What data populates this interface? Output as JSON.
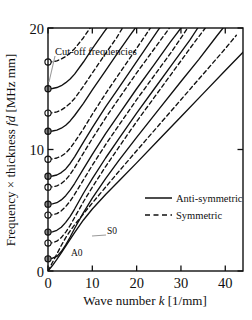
{
  "figure": {
    "kind": "lamb-wave-dispersion-plot",
    "background_color": "#ffffff",
    "line_color": "#101010",
    "frame_color": "#101010",
    "marker_open_fill": "#ffffff",
    "marker_filled_fill": "#8c8c8c",
    "leader_color": "#9a9a9a"
  },
  "chart_data": {
    "type": "line",
    "title": "",
    "xlabel_parts": {
      "pre": "Wave number ",
      "italic": "k",
      "post": " [1/mm]"
    },
    "ylabel_parts": {
      "pre": "Frequency × thickness ",
      "italic": "fd",
      "post": " [MHz mm]"
    },
    "xlabel": "Wave number k [1/mm]",
    "ylabel": "Frequency × thickness fd [MHz mm]",
    "xlim": [
      0,
      44
    ],
    "ylim": [
      0,
      20
    ],
    "xticks": [
      0,
      10,
      20,
      30,
      40
    ],
    "xtick_labels": [
      "0",
      "10",
      "20",
      "30",
      "40"
    ],
    "yticks": [
      0,
      10,
      20
    ],
    "ytick_labels": [
      "0",
      "10",
      "20"
    ],
    "grid": false,
    "legend_position": "center-right",
    "legend": [
      {
        "label": "Anti-symmetric",
        "style": "solid"
      },
      {
        "label": "Symmetric",
        "style": "dashed"
      }
    ],
    "annotations": [
      {
        "text": "Cut-off frequencies",
        "x_px": 55,
        "y_px": 52,
        "leader_to_x_px": 49,
        "leader_to_y_px": 82
      },
      {
        "text": "S0",
        "x_px": 106,
        "y_px": 231,
        "leader_to_x_px": 92,
        "leader_to_y_px": 236
      },
      {
        "text": "A0",
        "x_px": 71,
        "y_px": 253
      }
    ],
    "cutoff_frequencies": [
      {
        "fd": 1.0,
        "marker": "filled",
        "mode": "A1"
      },
      {
        "fd": 2.3,
        "marker": "open",
        "mode": "S1"
      },
      {
        "fd": 3.2,
        "marker": "filled",
        "mode": "A2"
      },
      {
        "fd": 4.6,
        "marker": "open",
        "mode": "S2"
      },
      {
        "fd": 5.5,
        "marker": "filled",
        "mode": "A3"
      },
      {
        "fd": 6.9,
        "marker": "open",
        "mode": "S3"
      },
      {
        "fd": 7.8,
        "marker": "filled",
        "mode": "A4"
      },
      {
        "fd": 9.2,
        "marker": "open",
        "mode": "S4"
      },
      {
        "fd": 11.5,
        "marker": "filled",
        "mode": "A5"
      },
      {
        "fd": 13.0,
        "marker": "open",
        "mode": "S5"
      },
      {
        "fd": 15.0,
        "marker": "filled",
        "mode": "A6"
      },
      {
        "fd": 17.2,
        "marker": "open",
        "mode": "S6"
      }
    ],
    "series": [
      {
        "name": "A0",
        "style": "solid",
        "points": [
          [
            0,
            0
          ],
          [
            1,
            0.45
          ],
          [
            2,
            0.95
          ],
          [
            3,
            1.5
          ],
          [
            4,
            2.05
          ],
          [
            5,
            2.6
          ],
          [
            6,
            3.15
          ],
          [
            8,
            4.2
          ],
          [
            10,
            5.1
          ],
          [
            13,
            6.3
          ],
          [
            16,
            7.4
          ],
          [
            20,
            8.9
          ],
          [
            25,
            10.8
          ],
          [
            30,
            12.7
          ],
          [
            35,
            14.6
          ],
          [
            40,
            16.5
          ],
          [
            44,
            18.0
          ]
        ]
      },
      {
        "name": "S0",
        "style": "dashed",
        "points": [
          [
            0,
            0
          ],
          [
            1,
            0.7
          ],
          [
            2,
            1.4
          ],
          [
            3,
            2.1
          ],
          [
            4,
            2.75
          ],
          [
            5,
            3.3
          ],
          [
            6,
            3.8
          ],
          [
            8,
            4.7
          ],
          [
            10,
            5.6
          ],
          [
            13,
            6.9
          ],
          [
            16,
            8.2
          ],
          [
            20,
            9.9
          ],
          [
            25,
            12.0
          ],
          [
            30,
            14.1
          ],
          [
            35,
            16.2
          ],
          [
            40,
            18.3
          ],
          [
            42.5,
            19.4
          ]
        ]
      },
      {
        "name": "A1",
        "style": "solid",
        "points": [
          [
            0,
            1.0
          ],
          [
            1,
            1.05
          ],
          [
            2,
            1.2
          ],
          [
            3,
            1.6
          ],
          [
            4,
            2.15
          ],
          [
            5,
            2.8
          ],
          [
            6,
            3.5
          ],
          [
            8,
            4.8
          ],
          [
            10,
            6.0
          ],
          [
            13,
            7.6
          ],
          [
            16,
            9.1
          ],
          [
            20,
            11.0
          ],
          [
            25,
            13.3
          ],
          [
            30,
            15.6
          ],
          [
            34,
            17.4
          ],
          [
            38,
            19.3
          ],
          [
            39.5,
            20.0
          ]
        ]
      },
      {
        "name": "S1",
        "style": "dashed",
        "points": [
          [
            0,
            2.3
          ],
          [
            1,
            2.32
          ],
          [
            2,
            2.45
          ],
          [
            3,
            2.75
          ],
          [
            4,
            3.2
          ],
          [
            5,
            3.75
          ],
          [
            6,
            4.4
          ],
          [
            8,
            5.7
          ],
          [
            10,
            6.9
          ],
          [
            13,
            8.6
          ],
          [
            16,
            10.2
          ],
          [
            20,
            12.3
          ],
          [
            25,
            14.8
          ],
          [
            29,
            16.8
          ],
          [
            33,
            18.8
          ],
          [
            35.5,
            20.0
          ]
        ]
      },
      {
        "name": "A2",
        "style": "solid",
        "points": [
          [
            0,
            3.2
          ],
          [
            1,
            3.22
          ],
          [
            2,
            3.35
          ],
          [
            3,
            3.6
          ],
          [
            4,
            4.0
          ],
          [
            5,
            4.5
          ],
          [
            6,
            5.1
          ],
          [
            8,
            6.4
          ],
          [
            10,
            7.6
          ],
          [
            13,
            9.3
          ],
          [
            16,
            10.9
          ],
          [
            20,
            13.0
          ],
          [
            24,
            15.0
          ],
          [
            28,
            17.0
          ],
          [
            32,
            19.0
          ],
          [
            33.8,
            20.0
          ]
        ]
      },
      {
        "name": "S2",
        "style": "dashed",
        "points": [
          [
            0,
            4.6
          ],
          [
            1,
            4.62
          ],
          [
            2,
            4.72
          ],
          [
            3,
            4.95
          ],
          [
            4,
            5.3
          ],
          [
            5,
            5.75
          ],
          [
            6,
            6.3
          ],
          [
            8,
            7.5
          ],
          [
            10,
            8.7
          ],
          [
            13,
            10.4
          ],
          [
            16,
            12.0
          ],
          [
            20,
            14.1
          ],
          [
            24,
            16.1
          ],
          [
            28,
            18.1
          ],
          [
            31.5,
            20.0
          ]
        ]
      },
      {
        "name": "A3",
        "style": "solid",
        "points": [
          [
            0,
            5.5
          ],
          [
            1,
            5.52
          ],
          [
            2,
            5.62
          ],
          [
            3,
            5.85
          ],
          [
            4,
            6.2
          ],
          [
            5,
            6.65
          ],
          [
            6,
            7.2
          ],
          [
            8,
            8.4
          ],
          [
            10,
            9.6
          ],
          [
            13,
            11.3
          ],
          [
            16,
            12.9
          ],
          [
            20,
            15.0
          ],
          [
            24,
            17.0
          ],
          [
            27.5,
            18.8
          ],
          [
            30,
            20.0
          ]
        ]
      },
      {
        "name": "S3",
        "style": "dashed",
        "points": [
          [
            0,
            6.9
          ],
          [
            1,
            6.92
          ],
          [
            2,
            7.0
          ],
          [
            3,
            7.2
          ],
          [
            4,
            7.5
          ],
          [
            5,
            7.95
          ],
          [
            6,
            8.5
          ],
          [
            8,
            9.7
          ],
          [
            10,
            10.9
          ],
          [
            13,
            12.6
          ],
          [
            16,
            14.2
          ],
          [
            20,
            16.3
          ],
          [
            23,
            17.8
          ],
          [
            26,
            19.3
          ],
          [
            27.4,
            20.0
          ]
        ]
      },
      {
        "name": "A4",
        "style": "solid",
        "points": [
          [
            0,
            7.8
          ],
          [
            1,
            7.82
          ],
          [
            2,
            7.9
          ],
          [
            3,
            8.1
          ],
          [
            4,
            8.4
          ],
          [
            5,
            8.85
          ],
          [
            6,
            9.4
          ],
          [
            8,
            10.6
          ],
          [
            10,
            11.8
          ],
          [
            13,
            13.5
          ],
          [
            16,
            15.1
          ],
          [
            19,
            16.7
          ],
          [
            22,
            18.3
          ],
          [
            25,
            19.9
          ],
          [
            25.2,
            20.0
          ]
        ]
      },
      {
        "name": "S4",
        "style": "dashed",
        "points": [
          [
            0,
            9.2
          ],
          [
            1,
            9.22
          ],
          [
            2,
            9.3
          ],
          [
            3,
            9.45
          ],
          [
            4,
            9.7
          ],
          [
            5,
            10.1
          ],
          [
            6,
            10.6
          ],
          [
            8,
            11.7
          ],
          [
            10,
            12.9
          ],
          [
            13,
            14.6
          ],
          [
            16,
            16.2
          ],
          [
            19,
            17.8
          ],
          [
            22,
            19.4
          ],
          [
            23.1,
            20.0
          ]
        ]
      },
      {
        "name": "A5",
        "style": "solid",
        "points": [
          [
            0,
            11.5
          ],
          [
            1,
            11.52
          ],
          [
            2,
            11.6
          ],
          [
            3,
            11.75
          ],
          [
            4,
            12.0
          ],
          [
            5,
            12.35
          ],
          [
            6,
            12.8
          ],
          [
            8,
            13.8
          ],
          [
            10,
            14.9
          ],
          [
            13,
            16.5
          ],
          [
            16,
            18.1
          ],
          [
            18.5,
            19.4
          ],
          [
            19.7,
            20.0
          ]
        ]
      },
      {
        "name": "S5",
        "style": "dashed",
        "points": [
          [
            0,
            13.0
          ],
          [
            1,
            13.02
          ],
          [
            2,
            13.1
          ],
          [
            3,
            13.25
          ],
          [
            4,
            13.5
          ],
          [
            5,
            13.8
          ],
          [
            6,
            14.2
          ],
          [
            8,
            15.2
          ],
          [
            10,
            16.3
          ],
          [
            13,
            17.9
          ],
          [
            15.5,
            19.2
          ],
          [
            16.8,
            20.0
          ]
        ]
      },
      {
        "name": "A6",
        "style": "solid",
        "points": [
          [
            0,
            15.0
          ],
          [
            1,
            15.02
          ],
          [
            2,
            15.1
          ],
          [
            3,
            15.25
          ],
          [
            4,
            15.5
          ],
          [
            5,
            15.8
          ],
          [
            6,
            16.2
          ],
          [
            8,
            17.2
          ],
          [
            10,
            18.3
          ],
          [
            12.5,
            19.6
          ],
          [
            13.3,
            20.0
          ]
        ]
      },
      {
        "name": "S6",
        "style": "dashed",
        "points": [
          [
            0,
            17.2
          ],
          [
            1,
            17.22
          ],
          [
            2,
            17.3
          ],
          [
            3,
            17.45
          ],
          [
            4,
            17.65
          ],
          [
            5,
            17.95
          ],
          [
            6,
            18.3
          ],
          [
            8,
            19.2
          ],
          [
            9.5,
            20.0
          ]
        ]
      }
    ]
  }
}
